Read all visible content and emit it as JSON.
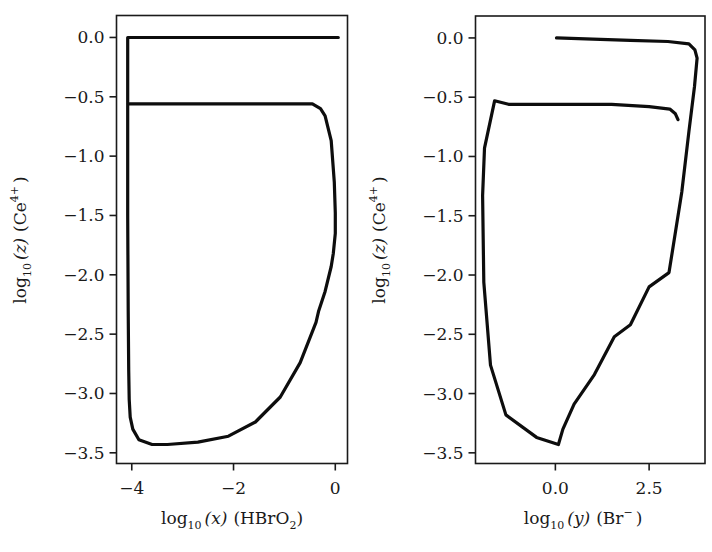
{
  "chart_data": [
    {
      "type": "line",
      "panel": "left",
      "title": "",
      "xlabel": "log10(x) (HBrO2)",
      "ylabel": "log10(z) (Ce4+)",
      "xlim": [
        -4.3,
        0.24
      ],
      "ylim": [
        -3.59,
        0.185
      ],
      "xticks": [
        -4,
        -2,
        0
      ],
      "xtick_labels": [
        "−4",
        "−2",
        "0"
      ],
      "yticks": [
        0.0,
        -0.5,
        -1.0,
        -1.5,
        -2.0,
        -2.5,
        -3.0,
        -3.5
      ],
      "ytick_labels": [
        "0.0",
        "−0.5",
        "−1.0",
        "−1.5",
        "−2.0",
        "−2.5",
        "−3.0",
        "−3.5"
      ],
      "grid": false,
      "legend": null,
      "series": [
        {
          "name": "trajectory",
          "color": "#0d0d0d",
          "x": [
            0.06,
            -1.0,
            -2.0,
            -3.0,
            -4.08,
            -4.08,
            -4.08,
            -4.07,
            -4.06,
            -4.05,
            -4.03,
            -3.98,
            -3.86,
            -3.6,
            -3.3,
            -2.7,
            -2.1,
            -1.57,
            -1.08,
            -0.69,
            -0.38,
            -0.33,
            -0.2,
            -0.08,
            -0.04,
            0.0,
            0.0,
            -0.02,
            -0.08,
            -0.2,
            -0.29,
            -0.45,
            -1.0,
            -2.0,
            -3.0,
            -4.04
          ],
          "y": [
            0.0,
            0.0,
            0.0,
            0.0,
            0.0,
            -0.56,
            -1.5,
            -2.3,
            -2.8,
            -3.05,
            -3.2,
            -3.3,
            -3.39,
            -3.43,
            -3.43,
            -3.41,
            -3.36,
            -3.24,
            -3.03,
            -2.74,
            -2.4,
            -2.31,
            -2.14,
            -1.93,
            -1.82,
            -1.65,
            -1.48,
            -1.22,
            -0.87,
            -0.66,
            -0.6,
            -0.56,
            -0.56,
            -0.56,
            -0.56,
            -0.56
          ]
        }
      ]
    },
    {
      "type": "line",
      "panel": "right",
      "title": "",
      "xlabel": "log10(y) (Br−)",
      "ylabel": "log10(z) (Ce4+)",
      "xlim": [
        -2.13,
        3.99
      ],
      "ylim": [
        -3.59,
        0.185
      ],
      "xticks": [
        0.0,
        2.5
      ],
      "xtick_labels": [
        "0.0",
        "2.5"
      ],
      "yticks": [
        0.0,
        -0.5,
        -1.0,
        -1.5,
        -2.0,
        -2.5,
        -3.0,
        -3.5
      ],
      "ytick_labels": [
        "0.0",
        "−0.5",
        "−1.0",
        "−1.5",
        "−2.0",
        "−2.5",
        "−3.0",
        "−3.5"
      ],
      "grid": false,
      "legend": null,
      "series": [
        {
          "name": "trajectory",
          "color": "#0d0d0d",
          "x": [
            0.03,
            1.0,
            2.0,
            3.0,
            3.56,
            3.72,
            3.78,
            3.71,
            3.56,
            3.37,
            3.03,
            2.5,
            2.0,
            1.57,
            1.04,
            0.5,
            0.2,
            0.08,
            -0.5,
            -1.32,
            -1.73,
            -1.91,
            -1.94,
            -1.89,
            -1.62,
            -1.25,
            -0.93,
            -0.64,
            -0.27,
            -0.08,
            0.5,
            1.5,
            2.5,
            3.05,
            3.2,
            3.27
          ],
          "y": [
            0.0,
            -0.01,
            -0.02,
            -0.03,
            -0.05,
            -0.1,
            -0.17,
            -0.41,
            -0.79,
            -1.3,
            -1.98,
            -2.1,
            -2.42,
            -2.52,
            -2.84,
            -3.09,
            -3.3,
            -3.43,
            -3.37,
            -3.18,
            -2.76,
            -2.06,
            -1.33,
            -0.93,
            -0.53,
            -0.56,
            -0.56,
            -0.56,
            -0.56,
            -0.56,
            -0.56,
            -0.56,
            -0.58,
            -0.6,
            -0.64,
            -0.69
          ]
        }
      ]
    }
  ],
  "panels": {
    "left": {
      "xlabel_main": "log",
      "xlabel_sub": "10",
      "xlabel_var": "(x)",
      "xlabel_species": "(HBrO",
      "xlabel_species_sub": "2",
      "xlabel_close": ")",
      "ylabel_main": "log",
      "ylabel_sub": "10",
      "ylabel_var": "(z)",
      "ylabel_species": "(Ce",
      "ylabel_species_sup": "4+",
      "ylabel_close": ")"
    },
    "right": {
      "xlabel_main": "log",
      "xlabel_sub": "10",
      "xlabel_var": "(y)",
      "xlabel_species": "(Br",
      "xlabel_species_sup": "−",
      "xlabel_close": ")",
      "ylabel_main": "log",
      "ylabel_sub": "10",
      "ylabel_var": "(z)",
      "ylabel_species": "(Ce",
      "ylabel_species_sup": "4+",
      "ylabel_close": ")"
    }
  }
}
